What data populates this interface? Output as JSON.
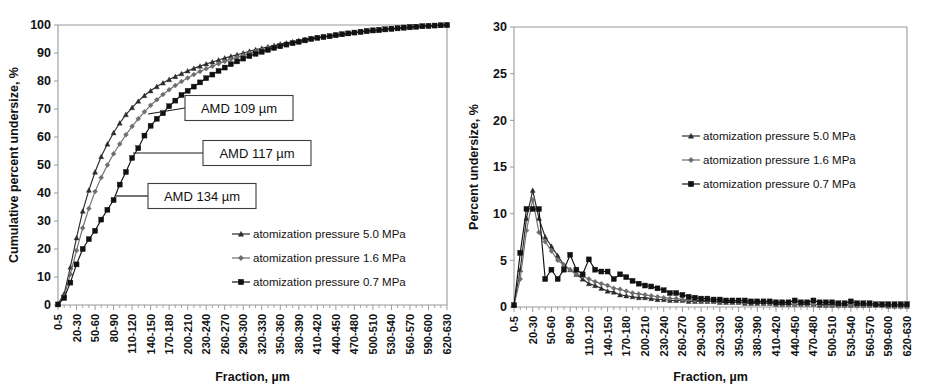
{
  "figure": {
    "panel_count": 2,
    "background_color": "#ffffff"
  },
  "colors": {
    "series_5_0": "#2b2b2b",
    "series_1_6": "#6e6e6e",
    "series_0_7": "#111111",
    "axis": "#9a9a9a",
    "text": "#111111",
    "callout_border": "#3d3d3d"
  },
  "series_names": {
    "p50": "atomization pressure 5.0 MPa",
    "p16": "atomization pressure 1.6 MPa",
    "p07": "atomization pressure 0.7 MPa"
  },
  "markers": {
    "p50": "triangle",
    "p16": "diamond",
    "p07": "square"
  },
  "x_categories": [
    "0-5",
    "5-10",
    "10-20",
    "20-30",
    "30-40",
    "40-50",
    "50-60",
    "60-70",
    "70-80",
    "80-90",
    "90-100",
    "100-110",
    "110-120",
    "120-130",
    "130-140",
    "140-150",
    "150-160",
    "160-170",
    "170-180",
    "180-190",
    "190-200",
    "200-210",
    "210-220",
    "220-230",
    "230-240",
    "240-250",
    "250-260",
    "260-270",
    "270-280",
    "280-290",
    "290-300",
    "300-310",
    "310-320",
    "320-330",
    "330-340",
    "340-350",
    "350-360",
    "360-370",
    "370-380",
    "380-390",
    "390-400",
    "400-410",
    "410-420",
    "420-430",
    "430-440",
    "440-450",
    "450-460",
    "460-470",
    "470-480",
    "480-490",
    "490-500",
    "500-510",
    "510-520",
    "520-530",
    "530-540",
    "540-550",
    "550-560",
    "560-570",
    "570-580",
    "580-590",
    "590-600",
    "600-610",
    "610-620",
    "620-630"
  ],
  "x_tick_labels_shown": [
    "0-5",
    "20-30",
    "50-60",
    "80-90",
    "110-120",
    "140-150",
    "170-180",
    "200-210",
    "230-240",
    "260-270",
    "290-300",
    "320-330",
    "350-360",
    "380-390",
    "410-420",
    "440-450",
    "470-480",
    "500-510",
    "530-540",
    "560-570",
    "590-600",
    "620-630"
  ],
  "chart_data": [
    {
      "id": "cumulative-undersize",
      "type": "line",
      "title": "",
      "xlabel": "Fraction, µm",
      "ylabel": "Cumulative percent undersize, %",
      "ylim": [
        0,
        100
      ],
      "yticks": [
        0,
        10,
        20,
        30,
        40,
        50,
        60,
        70,
        80,
        90,
        100
      ],
      "grid": false,
      "legend_position": "inside-lower-right",
      "categories": [
        "0-5",
        "5-10",
        "10-20",
        "20-30",
        "30-40",
        "40-50",
        "50-60",
        "60-70",
        "70-80",
        "80-90",
        "90-100",
        "100-110",
        "110-120",
        "120-130",
        "130-140",
        "140-150",
        "150-160",
        "160-170",
        "170-180",
        "180-190",
        "190-200",
        "200-210",
        "210-220",
        "220-230",
        "230-240",
        "240-250",
        "250-260",
        "260-270",
        "270-280",
        "280-290",
        "290-300",
        "300-310",
        "310-320",
        "320-330",
        "330-340",
        "340-350",
        "350-360",
        "360-370",
        "370-380",
        "380-390",
        "390-400",
        "400-410",
        "410-420",
        "420-430",
        "430-440",
        "440-450",
        "450-460",
        "460-470",
        "470-480",
        "480-490",
        "490-500",
        "500-510",
        "510-520",
        "520-530",
        "530-540",
        "540-550",
        "550-560",
        "560-570",
        "570-580",
        "580-590",
        "590-600",
        "600-610",
        "610-620",
        "620-630"
      ],
      "series": [
        {
          "name": "atomization pressure 5.0 MPa",
          "marker": "triangle",
          "color": "#2b2b2b",
          "values": [
            0.3,
            4.0,
            13.5,
            24.0,
            33.5,
            41.0,
            47.5,
            53.0,
            57.5,
            61.5,
            65.0,
            68.0,
            70.5,
            72.8,
            74.8,
            76.5,
            78.0,
            79.3,
            80.5,
            81.6,
            82.6,
            83.6,
            84.5,
            85.3,
            86.1,
            86.8,
            87.5,
            88.2,
            88.8,
            89.4,
            90.0,
            90.6,
            91.2,
            91.7,
            92.2,
            92.7,
            93.2,
            93.6,
            94.0,
            94.4,
            94.8,
            95.2,
            95.5,
            95.8,
            96.1,
            96.4,
            96.7,
            97.0,
            97.3,
            97.5,
            97.7,
            97.9,
            98.1,
            98.3,
            98.5,
            98.7,
            98.9,
            99.1,
            99.3,
            99.5,
            99.6,
            99.8,
            99.9,
            100.0
          ]
        },
        {
          "name": "atomization pressure 1.6 MPa",
          "marker": "diamond",
          "color": "#6e6e6e",
          "values": [
            0.2,
            3.0,
            11.0,
            19.5,
            27.5,
            34.5,
            40.5,
            45.5,
            50.0,
            54.0,
            57.5,
            60.8,
            63.8,
            66.5,
            69.0,
            71.3,
            73.3,
            75.2,
            76.9,
            78.4,
            79.8,
            81.1,
            82.3,
            83.4,
            84.4,
            85.3,
            86.2,
            87.0,
            87.8,
            88.5,
            89.2,
            89.9,
            90.5,
            91.1,
            91.7,
            92.3,
            92.8,
            93.3,
            93.8,
            94.3,
            94.7,
            95.1,
            95.5,
            95.8,
            96.1,
            96.4,
            96.7,
            97.0,
            97.3,
            97.6,
            97.8,
            98.0,
            98.2,
            98.4,
            98.6,
            98.8,
            99.0,
            99.2,
            99.4,
            99.5,
            99.7,
            99.8,
            99.9,
            100.0
          ]
        },
        {
          "name": "atomization pressure 0.7 MPa",
          "marker": "square",
          "color": "#111111",
          "values": [
            0.2,
            2.5,
            8.0,
            14.5,
            20.0,
            23.5,
            26.5,
            30.5,
            34.0,
            37.5,
            43.0,
            47.5,
            52.5,
            56.0,
            60.5,
            64.0,
            66.5,
            68.5,
            71.0,
            73.0,
            75.0,
            76.5,
            78.0,
            79.5,
            81.0,
            82.3,
            83.6,
            84.8,
            86.0,
            87.0,
            88.0,
            88.9,
            89.7,
            90.4,
            91.1,
            91.8,
            92.4,
            93.0,
            93.5,
            94.0,
            94.5,
            95.0,
            95.4,
            95.7,
            96.0,
            96.4,
            96.7,
            97.0,
            97.3,
            97.6,
            97.9,
            98.1,
            98.3,
            98.5,
            98.7,
            98.9,
            99.1,
            99.3,
            99.4,
            99.6,
            99.7,
            99.8,
            99.9,
            100.0
          ]
        }
      ],
      "annotations": [
        {
          "label": "AMD 109 µm",
          "target_series": "atomization pressure 5.0 MPa"
        },
        {
          "label": "AMD 117 µm",
          "target_series": "atomization pressure 1.6 MPa"
        },
        {
          "label": "AMD 134 µm",
          "target_series": "atomization pressure 0.7 MPa"
        }
      ]
    },
    {
      "id": "percent-undersize",
      "type": "line",
      "title": "",
      "xlabel": "Fraction, µm",
      "ylabel": "Percent undersize, %",
      "ylim": [
        0,
        30
      ],
      "yticks": [
        0,
        5,
        10,
        15,
        20,
        25,
        30
      ],
      "grid": false,
      "legend_position": "inside-upper-right",
      "categories": [
        "0-5",
        "5-10",
        "10-20",
        "20-30",
        "30-40",
        "40-50",
        "50-60",
        "60-70",
        "70-80",
        "80-90",
        "90-100",
        "100-110",
        "110-120",
        "120-130",
        "130-140",
        "140-150",
        "150-160",
        "160-170",
        "170-180",
        "180-190",
        "190-200",
        "200-210",
        "210-220",
        "220-230",
        "230-240",
        "240-250",
        "250-260",
        "260-270",
        "270-280",
        "280-290",
        "290-300",
        "300-310",
        "310-320",
        "320-330",
        "330-340",
        "340-350",
        "350-360",
        "360-370",
        "370-380",
        "380-390",
        "390-400",
        "400-410",
        "410-420",
        "420-430",
        "430-440",
        "440-450",
        "450-460",
        "460-470",
        "470-480",
        "480-490",
        "490-500",
        "500-510",
        "510-520",
        "520-530",
        "530-540",
        "540-550",
        "550-560",
        "560-570",
        "570-580",
        "580-590",
        "590-600",
        "600-610",
        "610-620",
        "620-630"
      ],
      "series": [
        {
          "name": "atomization pressure 5.0 MPa",
          "marker": "triangle",
          "color": "#2b2b2b",
          "values": [
            0.2,
            4.0,
            9.5,
            12.5,
            9.5,
            7.5,
            6.5,
            5.5,
            4.5,
            4.0,
            3.5,
            3.0,
            2.5,
            2.3,
            2.0,
            1.7,
            1.6,
            1.3,
            1.2,
            1.1,
            1.0,
            1.0,
            0.9,
            0.8,
            0.8,
            0.7,
            0.7,
            0.7,
            0.6,
            0.6,
            0.6,
            0.6,
            0.6,
            0.5,
            0.5,
            0.5,
            0.5,
            0.4,
            0.4,
            0.4,
            0.4,
            0.4,
            0.3,
            0.3,
            0.3,
            0.3,
            0.3,
            0.3,
            0.3,
            0.2,
            0.2,
            0.2,
            0.2,
            0.2,
            0.2,
            0.2,
            0.2,
            0.2,
            0.2,
            0.2,
            0.1,
            0.1,
            0.1,
            0.1
          ]
        },
        {
          "name": "atomization pressure 1.6 MPa",
          "marker": "diamond",
          "color": "#6e6e6e",
          "values": [
            0.2,
            3.0,
            8.2,
            11.5,
            8.0,
            7.0,
            6.0,
            5.0,
            4.5,
            4.0,
            3.5,
            3.3,
            3.0,
            2.7,
            2.5,
            2.3,
            2.0,
            1.9,
            1.7,
            1.5,
            1.4,
            1.3,
            1.2,
            1.1,
            1.0,
            0.9,
            0.9,
            0.8,
            0.8,
            0.7,
            0.7,
            0.7,
            0.6,
            0.6,
            0.6,
            0.6,
            0.5,
            0.5,
            0.5,
            0.5,
            0.4,
            0.4,
            0.4,
            0.3,
            0.3,
            0.3,
            0.3,
            0.3,
            0.3,
            0.3,
            0.2,
            0.2,
            0.2,
            0.2,
            0.2,
            0.2,
            0.2,
            0.2,
            0.2,
            0.2,
            0.1,
            0.1,
            0.1,
            0.1
          ]
        },
        {
          "name": "atomization pressure 0.7 MPa",
          "marker": "square",
          "color": "#111111",
          "values": [
            0.2,
            5.8,
            10.5,
            10.5,
            10.5,
            3.0,
            4.0,
            3.0,
            4.0,
            5.6,
            4.0,
            3.5,
            5.1,
            4.0,
            3.8,
            3.8,
            3.0,
            3.5,
            3.2,
            2.8,
            2.5,
            2.3,
            2.2,
            2.0,
            1.8,
            1.5,
            1.5,
            1.3,
            1.1,
            1.0,
            0.9,
            0.9,
            0.8,
            0.8,
            0.7,
            0.7,
            0.7,
            0.7,
            0.6,
            0.6,
            0.6,
            0.6,
            0.5,
            0.5,
            0.5,
            0.7,
            0.5,
            0.5,
            0.7,
            0.5,
            0.5,
            0.5,
            0.4,
            0.4,
            0.6,
            0.4,
            0.4,
            0.4,
            0.3,
            0.3,
            0.3,
            0.3,
            0.3,
            0.3
          ]
        }
      ],
      "annotations": []
    }
  ]
}
